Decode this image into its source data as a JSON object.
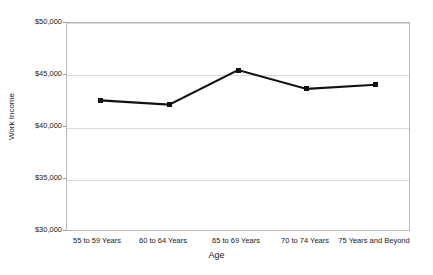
{
  "chart_data": {
    "type": "line",
    "title": "",
    "xlabel": "Age",
    "ylabel": "Work Income",
    "categories": [
      "55 to 59 Years",
      "60 to 64 Years",
      "65 to 69 Years",
      "70 to 74 Years",
      "75 Years and Beyond"
    ],
    "values": [
      42500,
      42100,
      45400,
      43600,
      44000
    ],
    "series": [
      {
        "name": "Work Income",
        "values": [
          42500,
          42100,
          45400,
          43600,
          44000
        ]
      }
    ],
    "ylim": [
      30000,
      50000
    ],
    "ytick_values": [
      30000,
      35000,
      40000,
      45000,
      50000
    ],
    "ytick_labels": [
      "$30,000",
      "$35,000",
      "$40,000",
      "$45,000",
      "$50,000"
    ],
    "grid": "horizontal",
    "legend": "none",
    "line_color": "#111111",
    "marker": "square",
    "marker_color": "#111111",
    "grid_color": "#d8d8d8",
    "frame_color": "#b9b9b9",
    "background_color": "#ffffff"
  }
}
